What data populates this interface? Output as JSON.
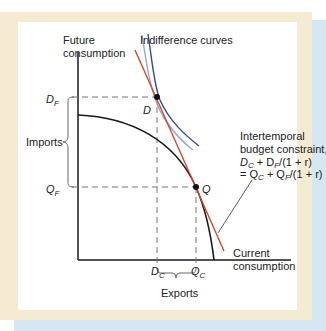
{
  "figure": {
    "y_axis_label": [
      "Future",
      "consumption"
    ],
    "x_axis_label": [
      "Current",
      "consumption"
    ],
    "indifference_label": "Indifference curves",
    "budget_label": [
      "Intertemporal",
      "budget constraint,"
    ],
    "budget_eq_line1": {
      "D1": "D",
      "s1": "C",
      "mid": " + D",
      "s2": "F",
      "tail": "/(1 + r)"
    },
    "budget_eq_line2": {
      "pre": "= Q",
      "s1": "C",
      "mid": " + Q",
      "s2": "F",
      "tail": "/(1 + r)"
    },
    "point_D": "D",
    "point_Q": "Q",
    "tick_DF": {
      "base": "D",
      "sub": "F"
    },
    "tick_QF": {
      "base": "Q",
      "sub": "F"
    },
    "tick_DC": {
      "base": "D",
      "sub": "C"
    },
    "tick_QC": {
      "base": "Q",
      "sub": "C"
    },
    "imports_label": "Imports",
    "exports_label": "Exports"
  },
  "colors": {
    "frame": "#f4ebd2",
    "blue_back": "#d6e6f3",
    "budget_line": "#d9452b",
    "indiff_dark": "#2f4f8f",
    "indiff_light": "#8fa8d8",
    "curve": "#1a1a1a"
  }
}
